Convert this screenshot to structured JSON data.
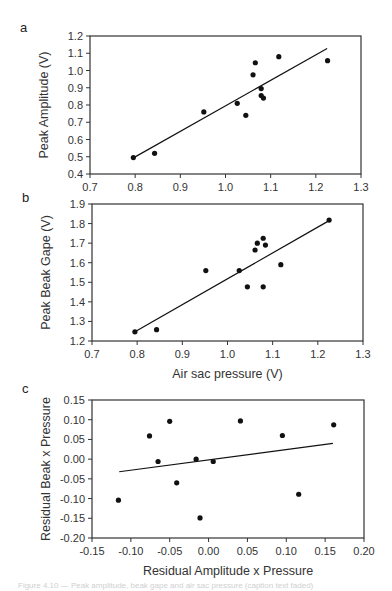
{
  "figure": {
    "caption_fragment": "Figure 4.10 — Peak amplitude, beak gape and air sac pressure (caption text faded)"
  },
  "chart_data": [
    {
      "panel": "a",
      "type": "scatter",
      "title": "",
      "xlabel": "",
      "ylabel": "Peak Amplitude (V)",
      "xlim": [
        0.7,
        1.3
      ],
      "ylim": [
        0.4,
        1.2
      ],
      "xticks": [
        0.7,
        0.8,
        0.9,
        1.0,
        1.1,
        1.2,
        1.3
      ],
      "xtick_labels": [
        "0.7",
        "0.8",
        "0.9",
        "1.0",
        "1.1",
        "1.2",
        "1.3"
      ],
      "yticks": [
        0.4,
        0.5,
        0.6,
        0.7,
        0.8,
        0.9,
        1.0,
        1.1,
        1.2
      ],
      "ytick_labels": [
        "0.4",
        "0.5",
        "0.6",
        "0.7",
        "0.8",
        "0.9",
        "1.0",
        "1.1",
        "1.2"
      ],
      "grid": false,
      "frame": {
        "left": 90,
        "top": 36,
        "right": 361,
        "bottom": 174
      },
      "points": [
        {
          "x": 0.796,
          "y": 0.495
        },
        {
          "x": 0.843,
          "y": 0.52
        },
        {
          "x": 0.952,
          "y": 0.76
        },
        {
          "x": 1.026,
          "y": 0.81
        },
        {
          "x": 1.045,
          "y": 0.74
        },
        {
          "x": 1.061,
          "y": 0.975
        },
        {
          "x": 1.066,
          "y": 1.045
        },
        {
          "x": 1.079,
          "y": 0.895
        },
        {
          "x": 1.079,
          "y": 0.855
        },
        {
          "x": 1.084,
          "y": 0.84
        },
        {
          "x": 1.118,
          "y": 1.08
        },
        {
          "x": 1.226,
          "y": 1.057
        }
      ],
      "regression_line": {
        "x1": 0.797,
        "y1": 0.495,
        "x2": 1.225,
        "y2": 1.128
      }
    },
    {
      "panel": "b",
      "type": "scatter",
      "title": "",
      "xlabel": "Air sac pressure (V)",
      "ylabel": "Peak Beak Gape (V)",
      "xlim": [
        0.7,
        1.3
      ],
      "ylim": [
        1.2,
        1.9
      ],
      "xticks": [
        0.7,
        0.8,
        0.9,
        1.0,
        1.1,
        1.2,
        1.3
      ],
      "xtick_labels": [
        "0.7",
        "0.8",
        "0.9",
        "1.0",
        "1.1",
        "1.2",
        "1.3"
      ],
      "yticks": [
        1.2,
        1.3,
        1.4,
        1.5,
        1.6,
        1.7,
        1.8,
        1.9
      ],
      "ytick_labels": [
        "1.2",
        "1.3",
        "1.4",
        "1.5",
        "1.6",
        "1.7",
        "1.8",
        "1.9"
      ],
      "grid": false,
      "frame": {
        "left": 92,
        "top": 204,
        "right": 363,
        "bottom": 341
      },
      "points": [
        {
          "x": 0.795,
          "y": 1.247
        },
        {
          "x": 0.843,
          "y": 1.258
        },
        {
          "x": 0.952,
          "y": 1.56
        },
        {
          "x": 1.026,
          "y": 1.56
        },
        {
          "x": 1.044,
          "y": 1.477
        },
        {
          "x": 1.061,
          "y": 1.665
        },
        {
          "x": 1.066,
          "y": 1.7
        },
        {
          "x": 1.079,
          "y": 1.725
        },
        {
          "x": 1.084,
          "y": 1.69
        },
        {
          "x": 1.079,
          "y": 1.477
        },
        {
          "x": 1.118,
          "y": 1.59
        },
        {
          "x": 1.225,
          "y": 1.818
        }
      ],
      "regression_line": {
        "x1": 0.797,
        "y1": 1.25,
        "x2": 1.225,
        "y2": 1.815
      }
    },
    {
      "panel": "c",
      "type": "scatter",
      "title": "",
      "xlabel": "Residual Amplitude x Pressure",
      "ylabel": "Residual Beak x Pressure",
      "xlim": [
        -0.15,
        0.2
      ],
      "ylim": [
        -0.2,
        0.15
      ],
      "xticks": [
        -0.15,
        -0.1,
        -0.05,
        0.0,
        0.05,
        0.1,
        0.15,
        0.2
      ],
      "xtick_labels": [
        "-0.15",
        "-0.10",
        "-0.05",
        "0.00",
        "0.05",
        "0.10",
        "0.15",
        "0.20"
      ],
      "yticks": [
        -0.2,
        -0.15,
        -0.1,
        -0.05,
        0.0,
        0.05,
        0.1,
        0.15
      ],
      "ytick_labels": [
        "-0.20",
        "-0.15",
        "-0.10",
        "-0.05",
        "0.00",
        "0.05",
        "0.10",
        "0.15"
      ],
      "grid": false,
      "frame": {
        "left": 92,
        "top": 400,
        "right": 364,
        "bottom": 538
      },
      "points": [
        {
          "x": -0.116,
          "y": -0.104
        },
        {
          "x": -0.076,
          "y": 0.059
        },
        {
          "x": -0.065,
          "y": -0.006
        },
        {
          "x": -0.05,
          "y": 0.096
        },
        {
          "x": -0.041,
          "y": -0.06
        },
        {
          "x": -0.016,
          "y": 0.0
        },
        {
          "x": 0.006,
          "y": -0.006
        },
        {
          "x": -0.011,
          "y": -0.149
        },
        {
          "x": 0.041,
          "y": 0.097
        },
        {
          "x": 0.095,
          "y": 0.06
        },
        {
          "x": 0.116,
          "y": -0.089
        },
        {
          "x": 0.161,
          "y": 0.087
        }
      ],
      "regression_line": {
        "x1": -0.115,
        "y1": -0.032,
        "x2": 0.16,
        "y2": 0.04
      }
    }
  ],
  "panels": {
    "a": {
      "label": "a"
    },
    "b": {
      "label": "b"
    },
    "c": {
      "label": "c"
    }
  },
  "style": {
    "axis_color": "#333333",
    "point_color": "#111111",
    "line_color": "#111111"
  }
}
